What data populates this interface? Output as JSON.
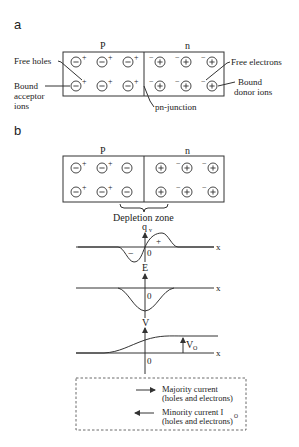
{
  "panel_a": {
    "label": "a",
    "p_label": "P",
    "n_label": "n",
    "annotations": {
      "free_holes": "Free holes",
      "bound_acceptor_1": "Bound",
      "bound_acceptor_2": "acceptor",
      "bound_acceptor_3": "ions",
      "free_electrons": "Free electrons",
      "bound_donor_1": "Bound",
      "bound_donor_2": "donor ions",
      "pn_junction": "pn-junction"
    }
  },
  "panel_b": {
    "label": "b",
    "p_label": "P",
    "n_label": "n",
    "depletion_zone": "Depletion zone",
    "plots": {
      "charge": {
        "ylabel": "q",
        "ylabel_sub": "v",
        "xlabel": "x",
        "origin": "0",
        "neg_sign": "−",
        "pos_sign": "+"
      },
      "field": {
        "ylabel": "E",
        "xlabel": "x",
        "origin": "0"
      },
      "potential": {
        "ylabel": "V",
        "xlabel": "x",
        "origin": "0",
        "v0_label": "V",
        "v0_sub": "O"
      }
    },
    "legend": {
      "majority_1": "Majority current",
      "majority_2": "(holes and electrons)",
      "minority_1": "Minority current I",
      "minority_sub": "O",
      "minority_2": "(holes and electrons)"
    }
  },
  "symbols": {
    "minus": "−",
    "plus": "+"
  }
}
